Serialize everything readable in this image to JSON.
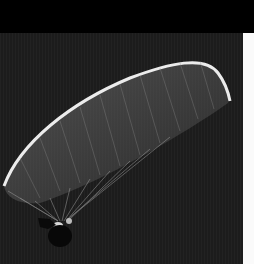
{
  "image": {
    "subject": "paraglider canopy in flight",
    "colors": {
      "top_band": "#000000",
      "sky": "#1c1c1c",
      "canopy_edge": "#e8e8e8",
      "canopy_fill": "#6a6a6a",
      "lines": "#9a9a9a",
      "pilot": "#0a0a0a",
      "right_strip": "#fafafa"
    }
  }
}
